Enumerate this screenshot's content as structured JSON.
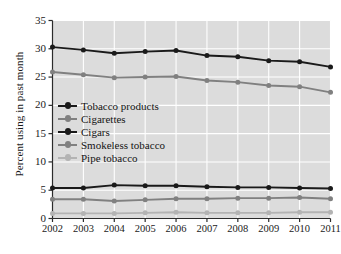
{
  "chart_data": {
    "type": "line",
    "title": "",
    "xlabel": "",
    "ylabel": "Percent using in past month",
    "x": [
      "2002",
      "2003",
      "2004",
      "2005",
      "2006",
      "2007",
      "2008",
      "2009",
      "2010",
      "2011"
    ],
    "xlim": [
      2002,
      2011
    ],
    "ylim": [
      0,
      35
    ],
    "yticks": [
      "0",
      "5",
      "10",
      "15",
      "20",
      "25",
      "30",
      "35"
    ],
    "grid": true,
    "legend_position": "inside-left",
    "plot_background": "#dcdcdc",
    "gridline_color": "#ffffff",
    "series": [
      {
        "name": "Tobacco products",
        "color": "#1a1a1a",
        "values": [
          30.3,
          29.8,
          29.2,
          29.5,
          29.7,
          28.8,
          28.6,
          27.9,
          27.7,
          26.8
        ]
      },
      {
        "name": "Cigarettes",
        "color": "#808080",
        "values": [
          25.9,
          25.4,
          24.9,
          25.0,
          25.1,
          24.4,
          24.1,
          23.5,
          23.3,
          22.3
        ]
      },
      {
        "name": "Cigars",
        "color": "#1a1a1a",
        "values": [
          5.4,
          5.4,
          5.9,
          5.8,
          5.8,
          5.6,
          5.5,
          5.5,
          5.4,
          5.3
        ]
      },
      {
        "name": "Smokeless tobacco",
        "color": "#808080",
        "values": [
          3.4,
          3.4,
          3.1,
          3.3,
          3.5,
          3.5,
          3.6,
          3.6,
          3.7,
          3.5
        ]
      },
      {
        "name": "Pipe tobacco",
        "color": "#b3b3b3",
        "values": [
          0.9,
          0.9,
          0.9,
          1.0,
          1.1,
          1.0,
          1.0,
          1.0,
          1.1,
          1.1
        ]
      }
    ]
  }
}
